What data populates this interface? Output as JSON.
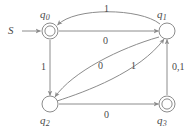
{
  "figure": {
    "kind": "finite-state-automaton-diagram",
    "colors": {
      "stroke": "#8c8c8c",
      "text": "#4a4a4a",
      "background": "#ffffff"
    }
  },
  "start": {
    "label": "S",
    "points_to": "q0"
  },
  "states": [
    {
      "id": "q0",
      "base": "q",
      "subscript": "0",
      "accepting": true,
      "x": 50,
      "y": 31,
      "label_x": 40,
      "label_y": 9
    },
    {
      "id": "q1",
      "base": "q",
      "subscript": "1",
      "accepting": false,
      "x": 167,
      "y": 31,
      "label_x": 157,
      "label_y": 9
    },
    {
      "id": "q2",
      "base": "q",
      "subscript": "2",
      "accepting": false,
      "x": 50,
      "y": 104,
      "label_x": 40,
      "label_y": 115
    },
    {
      "id": "q3",
      "base": "q",
      "subscript": "3",
      "accepting": true,
      "x": 167,
      "y": 104,
      "label_x": 157,
      "label_y": 115
    }
  ],
  "transitions": [
    {
      "id": "q1-q0",
      "from": "q1",
      "to": "q0",
      "symbol": "1",
      "shape": "curve-above",
      "label_x": 104,
      "label_y": 4
    },
    {
      "id": "q0-q1",
      "from": "q0",
      "to": "q1",
      "symbol": "0",
      "shape": "straight-horizontal",
      "label_x": 103,
      "label_y": 36
    },
    {
      "id": "q0-q2",
      "from": "q0",
      "to": "q2",
      "symbol": "1",
      "shape": "straight-vertical",
      "label_x": 41,
      "label_y": 62
    },
    {
      "id": "q1-q2",
      "from": "q1",
      "to": "q2",
      "symbol": "0",
      "shape": "curve-lens-lower",
      "label_x": 98,
      "label_y": 61
    },
    {
      "id": "q2-q1",
      "from": "q2",
      "to": "q1",
      "symbol": "1",
      "shape": "curve-lens-upper",
      "label_x": 131,
      "label_y": 61
    },
    {
      "id": "q2-q3",
      "from": "q2",
      "to": "q3",
      "symbol": "0",
      "shape": "straight-horizontal",
      "label_x": 104,
      "label_y": 110
    },
    {
      "id": "q3-q1",
      "from": "q3",
      "to": "q1",
      "symbol": "0,1",
      "shape": "straight-vertical",
      "label_x": 172,
      "label_y": 62
    }
  ]
}
